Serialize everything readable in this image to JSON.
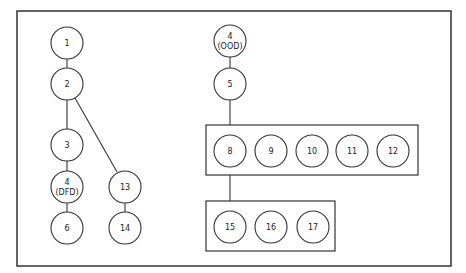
{
  "diagram": {
    "frame": {
      "x": 17,
      "y": 11,
      "w": 434,
      "h": 255
    },
    "boxes": [
      {
        "id": "box-top",
        "x": 206,
        "y": 125,
        "w": 212,
        "h": 50
      },
      {
        "id": "box-bottom",
        "x": 206,
        "y": 201,
        "w": 129,
        "h": 50
      }
    ],
    "nodes": [
      {
        "id": "n1",
        "label": "1",
        "sub": "",
        "x": 67,
        "y": 43
      },
      {
        "id": "n2",
        "label": "2",
        "sub": "",
        "x": 67,
        "y": 84
      },
      {
        "id": "n3",
        "label": "3",
        "sub": "",
        "x": 67,
        "y": 145
      },
      {
        "id": "n4dfd",
        "label": "4",
        "sub": "(DFD)",
        "x": 67,
        "y": 187
      },
      {
        "id": "n6",
        "label": "6",
        "sub": "",
        "x": 67,
        "y": 228
      },
      {
        "id": "n13",
        "label": "13",
        "sub": "",
        "x": 125,
        "y": 187
      },
      {
        "id": "n14",
        "label": "14",
        "sub": "",
        "x": 125,
        "y": 228
      },
      {
        "id": "n4ood",
        "label": "4",
        "sub": "(OOD)",
        "x": 230,
        "y": 41
      },
      {
        "id": "n5",
        "label": "5",
        "sub": "",
        "x": 230,
        "y": 84
      },
      {
        "id": "n8",
        "label": "8",
        "sub": "",
        "x": 230,
        "y": 151
      },
      {
        "id": "n9",
        "label": "9",
        "sub": "",
        "x": 271,
        "y": 151
      },
      {
        "id": "n10",
        "label": "10",
        "sub": "",
        "x": 312,
        "y": 151
      },
      {
        "id": "n11",
        "label": "11",
        "sub": "",
        "x": 352,
        "y": 151
      },
      {
        "id": "n12",
        "label": "12",
        "sub": "",
        "x": 393,
        "y": 151
      },
      {
        "id": "n15",
        "label": "15",
        "sub": "",
        "x": 230,
        "y": 227
      },
      {
        "id": "n16",
        "label": "16",
        "sub": "",
        "x": 271,
        "y": 227
      },
      {
        "id": "n17",
        "label": "17",
        "sub": "",
        "x": 313,
        "y": 227
      }
    ],
    "edges": [
      {
        "x1": 67,
        "y1": 59,
        "x2": 67,
        "y2": 68
      },
      {
        "x1": 67,
        "y1": 100,
        "x2": 67,
        "y2": 129
      },
      {
        "x1": 75,
        "y1": 98,
        "x2": 117,
        "y2": 172
      },
      {
        "x1": 67,
        "y1": 161,
        "x2": 67,
        "y2": 171
      },
      {
        "x1": 67,
        "y1": 203,
        "x2": 67,
        "y2": 212
      },
      {
        "x1": 125,
        "y1": 203,
        "x2": 125,
        "y2": 212
      },
      {
        "x1": 230,
        "y1": 57,
        "x2": 230,
        "y2": 68
      },
      {
        "x1": 230,
        "y1": 100,
        "x2": 230,
        "y2": 125
      },
      {
        "x1": 230,
        "y1": 175,
        "x2": 230,
        "y2": 201
      }
    ],
    "radius": 16
  }
}
